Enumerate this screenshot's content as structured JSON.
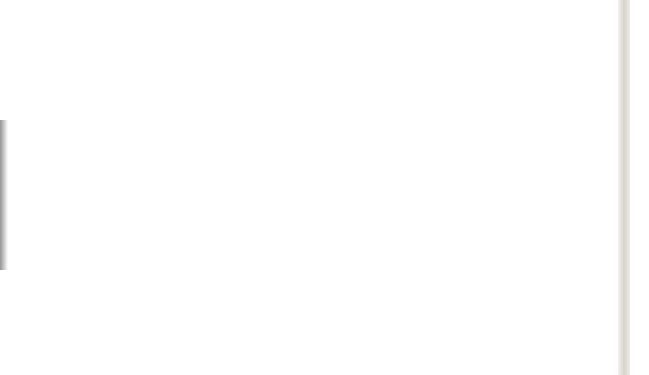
{
  "figure": {
    "gore_count": 8,
    "gore_centers_x": [
      38,
      114,
      190,
      266,
      342,
      419,
      495,
      571
    ],
    "north_tip_y": 33,
    "south_tip_y": 346,
    "equator_y": 189.5,
    "gore_half_width": 38,
    "graticule_step_deg": 15
  },
  "colors": {
    "ocean": "#d4eef8",
    "gridline": "#1a1a1a",
    "coastline": "#5aa8d8",
    "north_america": "#f6bf3e",
    "south_america": "#f6bf3e",
    "europe": "#ee9aa6",
    "africa": "#f8f08e",
    "asia": "#9ecb52",
    "oceania": "#a18cc6",
    "antarctica_ice": "#ffffff"
  },
  "continents": [
    {
      "name": "North America",
      "color_key": "north_america"
    },
    {
      "name": "South America",
      "color_key": "south_america"
    },
    {
      "name": "Europe",
      "color_key": "europe"
    },
    {
      "name": "Africa",
      "color_key": "africa"
    },
    {
      "name": "Asia",
      "color_key": "asia"
    },
    {
      "name": "Oceania",
      "color_key": "oceania"
    }
  ],
  "page_edge_bands": [
    {
      "color": "#5fb8b4",
      "top": 0,
      "height": 95
    },
    {
      "color": "#8a1f12",
      "top": 95,
      "height": 24
    },
    {
      "color": "#b9dc8c",
      "top": 119,
      "height": 136
    },
    {
      "color": "#8a1f12",
      "top": 255,
      "height": 28
    },
    {
      "color": "#f6d24a",
      "top": 283,
      "height": 92
    }
  ]
}
